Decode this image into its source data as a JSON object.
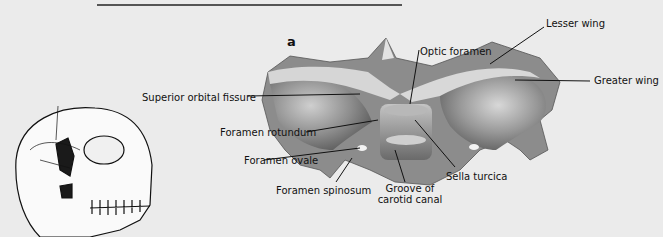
{
  "figure": {
    "panel_letter": "a",
    "labels": {
      "optic_foramen": "Optic foramen",
      "lesser_wing": "Lesser wing",
      "greater_wing": "Greater wing",
      "superior_orbital_fissure": "Superior orbital fissure",
      "foramen_rotundum": "Foramen rotundum",
      "foramen_ovale": "Foramen ovale",
      "foramen_spinosum": "Foramen spinosum",
      "groove_of_carotid_canal_line1": "Groove of",
      "groove_of_carotid_canal_line2": "carotid canal",
      "sella_turcica": "Sella turcica"
    },
    "colors": {
      "background": "#ebebeb",
      "bone_light": "#dcdcdc",
      "bone_mid": "#a8a8a8",
      "bone_dark": "#5a5a5a",
      "ink": "#111111",
      "highlight_region": "#1a1a1a"
    }
  }
}
